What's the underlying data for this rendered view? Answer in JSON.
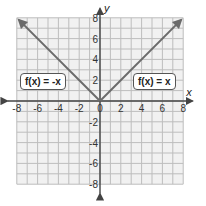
{
  "chart_data": {
    "type": "line",
    "title": "",
    "xlabel": "x",
    "ylabel": "y",
    "xlim": [
      -8,
      8
    ],
    "ylim": [
      -8,
      8
    ],
    "grid": true,
    "x_ticks": [
      -8,
      -6,
      -4,
      -2,
      0,
      2,
      4,
      6,
      8
    ],
    "y_ticks": [
      -8,
      -6,
      -4,
      -2,
      2,
      4,
      6,
      8
    ],
    "series": [
      {
        "name": "f(x) = -x",
        "x": [
          -7.8,
          0
        ],
        "y": [
          7.8,
          0
        ],
        "color": "#6b6b6b"
      },
      {
        "name": "f(x) = x",
        "x": [
          0,
          7.8
        ],
        "y": [
          0,
          7.8
        ],
        "color": "#6b6b6b"
      }
    ],
    "annotations": [
      {
        "text": "f(x) = -x",
        "x": -5.5,
        "y": 1.5
      },
      {
        "text": "f(x) = x",
        "x": 6,
        "y": 1.5
      }
    ]
  },
  "labels": {
    "left_fn": "f(x) = -x",
    "right_fn": "f(x) = x",
    "x_axis": "x",
    "y_axis": "y"
  },
  "colors": {
    "grid": "#bdbdbd",
    "grid_bg": "#f1f1f1",
    "axis": "#444444",
    "line": "#6b6b6b"
  }
}
